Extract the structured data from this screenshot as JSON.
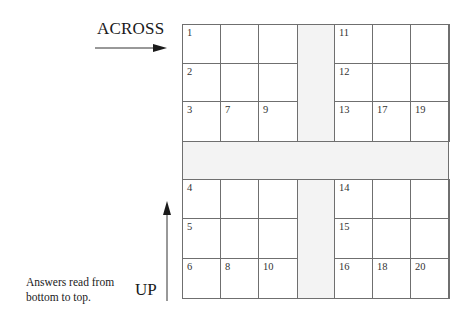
{
  "labels": {
    "across": "ACROSS",
    "up": "UP",
    "note_line1": "Answers read from",
    "note_line2": "bottom to top."
  },
  "colors": {
    "grid_line": "#6f6f6f",
    "band_fill": "#f3f3f3",
    "text": "#1a1a1a"
  },
  "grid": {
    "blocks": {
      "top_left": {
        "cells": [
          [
            "1",
            "",
            ""
          ],
          [
            "2",
            "",
            ""
          ],
          [
            "3",
            "7",
            "9"
          ]
        ]
      },
      "top_right": {
        "cells": [
          [
            "11",
            "",
            ""
          ],
          [
            "12",
            "",
            ""
          ],
          [
            "13",
            "17",
            "19"
          ]
        ]
      },
      "bottom_left": {
        "cells": [
          [
            "4",
            "",
            ""
          ],
          [
            "5",
            "",
            ""
          ],
          [
            "6",
            "8",
            "10"
          ]
        ]
      },
      "bottom_right": {
        "cells": [
          [
            "14",
            "",
            ""
          ],
          [
            "15",
            "",
            ""
          ],
          [
            "16",
            "18",
            "20"
          ]
        ]
      }
    }
  }
}
